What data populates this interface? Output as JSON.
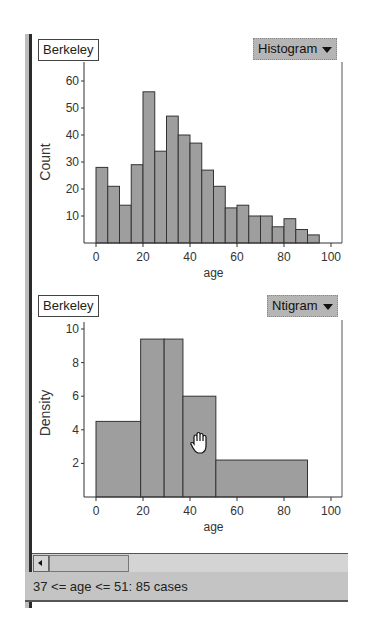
{
  "top_panel": {
    "dataset_label": "Berkeley",
    "plot_type_menu": "Histogram"
  },
  "bottom_panel": {
    "dataset_label": "Berkeley",
    "plot_type_menu": "Ntigram"
  },
  "status_bar": {
    "text": "37 <= age <= 51: 85 cases"
  },
  "cursor": "hand-icon",
  "colors": {
    "bar_fill": "#9e9e9e",
    "bar_stroke": "#333333",
    "menu_bg": "#b5b5b5",
    "status_bg": "#c4c4c4"
  },
  "chart_data": [
    {
      "type": "bar",
      "title": "Berkeley",
      "xlabel": "age",
      "ylabel": "Count",
      "bin_width": 5,
      "bin_edges": [
        0,
        5,
        10,
        15,
        20,
        25,
        30,
        35,
        40,
        45,
        50,
        55,
        60,
        65,
        70,
        75,
        80,
        85,
        90,
        95
      ],
      "values": [
        28,
        21,
        14,
        29,
        56,
        34,
        47,
        40,
        37,
        27,
        21,
        13,
        14,
        10,
        10,
        6,
        9,
        5,
        3
      ],
      "xlim": [
        0,
        100
      ],
      "ylim": [
        0,
        60
      ],
      "xticks": [
        "0",
        "20",
        "40",
        "60",
        "80",
        "100"
      ],
      "yticks": [
        "10",
        "20",
        "30",
        "40",
        "50",
        "60"
      ],
      "grid": false
    },
    {
      "type": "bar",
      "title": "Berkeley",
      "xlabel": "age",
      "ylabel": "Density",
      "bins": [
        {
          "from": 0,
          "to": 19,
          "value": 4.5
        },
        {
          "from": 19,
          "to": 29,
          "value": 9.4
        },
        {
          "from": 29,
          "to": 37,
          "value": 9.4
        },
        {
          "from": 37,
          "to": 51,
          "value": 6.0
        },
        {
          "from": 51,
          "to": 90,
          "value": 2.2
        }
      ],
      "xlim": [
        0,
        100
      ],
      "ylim": [
        0,
        10
      ],
      "xticks": [
        "0",
        "20",
        "40",
        "60",
        "80",
        "100"
      ],
      "yticks": [
        "2",
        "4",
        "6",
        "8",
        "10"
      ],
      "grid": false
    }
  ]
}
